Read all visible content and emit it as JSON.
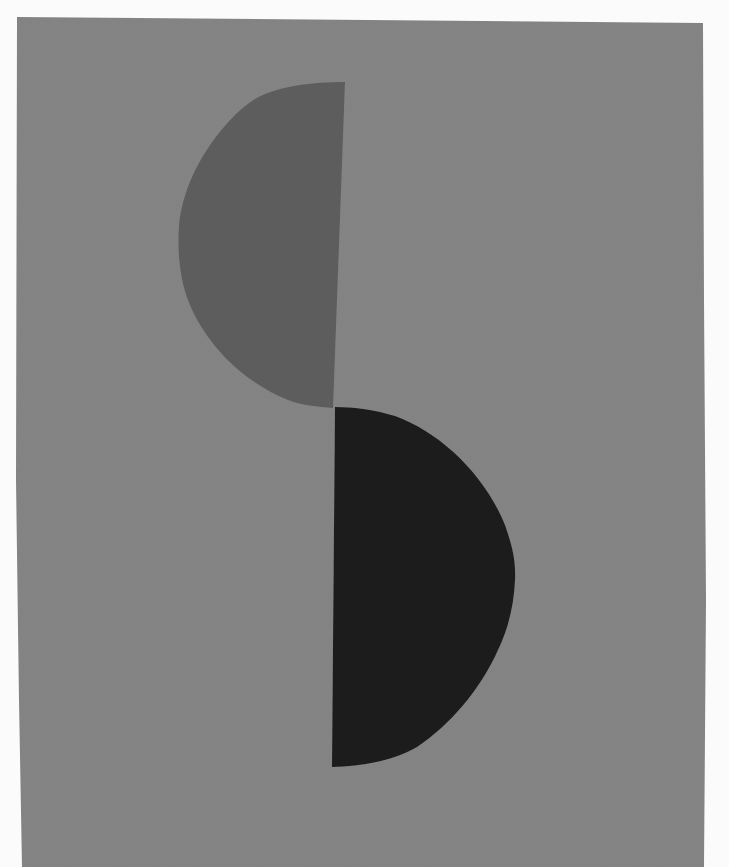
{
  "artwork": {
    "description": "Abstract composition: two half-discs on a grey ground",
    "colors": {
      "background": "#fbfbfb",
      "paper": "#858585",
      "upper_shape": "#5e5e5e",
      "lower_shape": "#1c1c1c"
    },
    "shapes": [
      {
        "name": "upper-half-disc",
        "orientation": "flat edge right, curve left"
      },
      {
        "name": "lower-half-disc",
        "orientation": "flat edge left, curve right"
      }
    ]
  }
}
